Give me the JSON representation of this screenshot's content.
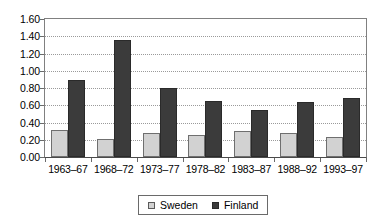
{
  "chart_data": {
    "type": "bar",
    "title": "",
    "subtitle": "",
    "xlabel": "",
    "ylabel": "",
    "categories": [
      "1963–67",
      "1968–72",
      "1973–77",
      "1978–82",
      "1983–87",
      "1988–92",
      "1993–97"
    ],
    "series": [
      {
        "name": "Sweden",
        "color": "#d2d2d2",
        "values": [
          0.31,
          0.21,
          0.28,
          0.26,
          0.3,
          0.28,
          0.23
        ]
      },
      {
        "name": "Finland",
        "color": "#3b3b3b",
        "values": [
          0.89,
          1.36,
          0.8,
          0.65,
          0.55,
          0.64,
          0.69
        ]
      }
    ],
    "ylim": [
      0.0,
      1.6
    ],
    "ytick_step": 0.2,
    "ytick_labels": [
      "0.00",
      "0.20",
      "0.40",
      "0.60",
      "0.80",
      "1.00",
      "1.20",
      "1.40",
      "1.60"
    ],
    "grid": true,
    "grid_style": "dotted",
    "legend_position": "bottom-center",
    "legend": [
      {
        "label": "Sweden",
        "marker": "light-gray-square"
      },
      {
        "label": "Finland",
        "marker": "dark-square"
      }
    ],
    "annotations": []
  }
}
